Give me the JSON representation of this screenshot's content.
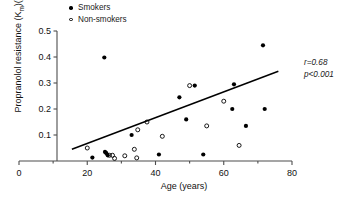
{
  "chart_data": {
    "type": "scatter",
    "title": "",
    "xlabel": "Age (years)",
    "ylabel": "Propranolol resistance (K",
    "ylabel_sub": "m",
    "ylabel_tail": ")(ng/ml)",
    "xlim": [
      0,
      80
    ],
    "ylim": [
      0,
      0.5
    ],
    "xticks": [
      0,
      20,
      40,
      60,
      80
    ],
    "xtick_labels": [
      "0",
      "20",
      "40",
      "60",
      "80"
    ],
    "xminor_ticks": [
      10,
      30,
      50,
      70
    ],
    "yticks": [
      0.1,
      0.2,
      0.3,
      0.4,
      0.5
    ],
    "ytick_labels": [
      "0.1",
      "0.2",
      "0.3",
      "0.4",
      "0.5"
    ],
    "grid": false,
    "legend_position": "top-center",
    "annotations": [
      "r=0.68",
      "p<0.001"
    ],
    "trendline": {
      "x": [
        15.5,
        76.0
      ],
      "y": [
        0.045,
        0.345
      ]
    },
    "series": [
      {
        "name": "Smokers",
        "marker": "filled-circle",
        "color": "#000000",
        "points": [
          [
            25.0,
            0.398
          ],
          [
            21.5,
            0.013
          ],
          [
            25.2,
            0.035
          ],
          [
            25.6,
            0.03
          ],
          [
            26.0,
            0.022
          ],
          [
            33.0,
            0.1
          ],
          [
            41.0,
            0.025
          ],
          [
            47.0,
            0.245
          ],
          [
            51.5,
            0.29
          ],
          [
            54.0,
            0.025
          ],
          [
            62.5,
            0.2
          ],
          [
            63.0,
            0.295
          ],
          [
            66.5,
            0.135
          ],
          [
            71.5,
            0.445
          ],
          [
            72.0,
            0.2
          ],
          [
            49.0,
            0.16
          ]
        ]
      },
      {
        "name": "Non-smokers",
        "marker": "open-circle",
        "color": "#000000",
        "points": [
          [
            20.0,
            0.05
          ],
          [
            26.5,
            0.022
          ],
          [
            27.4,
            0.022
          ],
          [
            28.0,
            0.01
          ],
          [
            31.0,
            0.02
          ],
          [
            33.8,
            0.045
          ],
          [
            34.5,
            0.012
          ],
          [
            34.8,
            0.12
          ],
          [
            37.5,
            0.15
          ],
          [
            42.0,
            0.095
          ],
          [
            50.0,
            0.29
          ],
          [
            55.0,
            0.135
          ],
          [
            60.0,
            0.23
          ],
          [
            64.5,
            0.06
          ]
        ]
      }
    ],
    "legend": [
      {
        "label": "Smokers",
        "marker": "filled-circle"
      },
      {
        "label": "Non-smokers",
        "marker": "open-circle"
      }
    ]
  },
  "legend": {
    "smokers_label": "Smokers",
    "nonsmokers_label": "Non-smokers"
  },
  "stats": {
    "r_text": "r=0.68",
    "p_text": "p<0.001"
  },
  "axes": {
    "x_title": "Age (years)",
    "y_title_head": "Propranolol resistance (K",
    "y_title_sub": "m",
    "y_title_tail": ")(ng/ml)"
  }
}
